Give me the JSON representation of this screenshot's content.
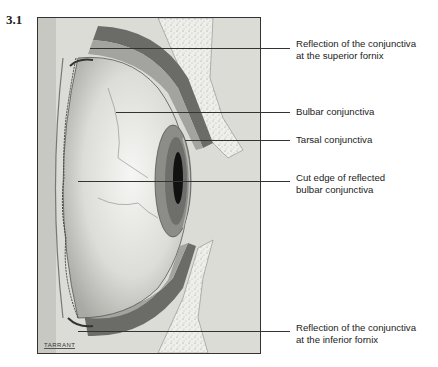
{
  "figure": {
    "number": "3.1",
    "artist_signature": "TARRANT"
  },
  "labels": [
    {
      "id": "superior-fornix",
      "line1": "Reflection of the conjunctiva",
      "line2": "at the superior fornix"
    },
    {
      "id": "bulbar",
      "line1": "Bulbar conjunctiva",
      "line2": ""
    },
    {
      "id": "tarsal",
      "line1": "Tarsal conjunctiva",
      "line2": ""
    },
    {
      "id": "cut-edge",
      "line1": "Cut edge of reflected",
      "line2": "bulbar conjunctiva"
    },
    {
      "id": "inferior-fornix",
      "line1": "Reflection of the conjunctiva",
      "line2": "at the inferior fornix"
    }
  ]
}
